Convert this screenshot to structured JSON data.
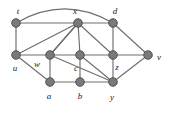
{
  "figure": {
    "width": 170,
    "height": 113,
    "background_color": "#ffffff",
    "node_fill_color": "#7a7a7a",
    "node_stroke_color": "#4a4a4a",
    "edge_color": "#6e6e6e",
    "label_color": "#1c1c1c"
  },
  "graph_data": {
    "type": "graph",
    "directed": false,
    "node_count": 11,
    "edge_count": 24,
    "nodes": [
      {
        "id": "t",
        "label": "t",
        "x": 16,
        "y": 23,
        "label_x": 18,
        "label_y": 11
      },
      {
        "id": "x",
        "label": "x",
        "x": 78,
        "y": 23,
        "label_x": 75,
        "label_y": 11
      },
      {
        "id": "d",
        "label": "d",
        "x": 113,
        "y": 23,
        "label_x": 115,
        "label_y": 11
      },
      {
        "id": "u",
        "label": "u",
        "x": 16,
        "y": 55,
        "label_x": 15,
        "label_y": 68
      },
      {
        "id": "w",
        "label": "w",
        "x": 50,
        "y": 55,
        "label_x": 37,
        "label_y": 64
      },
      {
        "id": "c",
        "label": "c",
        "x": 80,
        "y": 55,
        "label_x": 76,
        "label_y": 68
      },
      {
        "id": "z",
        "label": "z",
        "x": 113,
        "y": 55,
        "label_x": 117,
        "label_y": 67
      },
      {
        "id": "v",
        "label": "v",
        "x": 148,
        "y": 55,
        "label_x": 159,
        "label_y": 57
      },
      {
        "id": "a",
        "label": "a",
        "x": 50,
        "y": 82,
        "label_x": 49,
        "label_y": 96
      },
      {
        "id": "b",
        "label": "b",
        "x": 80,
        "y": 82,
        "label_x": 80,
        "label_y": 96
      },
      {
        "id": "y",
        "label": "y",
        "x": 113,
        "y": 82,
        "label_x": 112,
        "label_y": 97
      }
    ],
    "edges": [
      {
        "source": "t",
        "target": "x",
        "shape": "line"
      },
      {
        "source": "x",
        "target": "d",
        "shape": "line"
      },
      {
        "source": "t",
        "target": "d",
        "shape": "arc",
        "arc_peak_y": 8
      },
      {
        "source": "t",
        "target": "u",
        "shape": "line"
      },
      {
        "source": "u",
        "target": "x",
        "shape": "line"
      },
      {
        "source": "w",
        "target": "x",
        "shape": "line"
      },
      {
        "source": "c",
        "target": "x",
        "shape": "line"
      },
      {
        "source": "x",
        "target": "z",
        "shape": "line"
      },
      {
        "source": "d",
        "target": "z",
        "shape": "line"
      },
      {
        "source": "d",
        "target": "v",
        "shape": "line"
      },
      {
        "source": "u",
        "target": "w",
        "shape": "line"
      },
      {
        "source": "w",
        "target": "c",
        "shape": "line"
      },
      {
        "source": "c",
        "target": "z",
        "shape": "line"
      },
      {
        "source": "z",
        "target": "v",
        "shape": "line"
      },
      {
        "source": "u",
        "target": "a",
        "shape": "line"
      },
      {
        "source": "w",
        "target": "a",
        "shape": "line"
      },
      {
        "source": "w",
        "target": "y",
        "shape": "line"
      },
      {
        "source": "a",
        "target": "b",
        "shape": "line"
      },
      {
        "source": "b",
        "target": "c",
        "shape": "line"
      },
      {
        "source": "b",
        "target": "y",
        "shape": "line"
      },
      {
        "source": "c",
        "target": "y",
        "shape": "line"
      },
      {
        "source": "z",
        "target": "y",
        "shape": "line"
      },
      {
        "source": "y",
        "target": "v",
        "shape": "line"
      },
      {
        "source": "x",
        "target": "w",
        "shape": "line"
      }
    ]
  }
}
